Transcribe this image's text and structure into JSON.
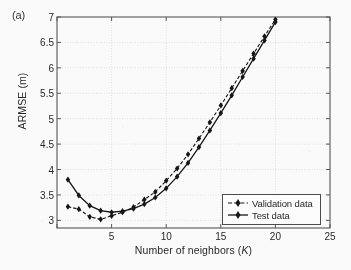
{
  "figure": {
    "panel_label": "(a)",
    "background_color": "#fdfdfd",
    "axis_color": "#555555",
    "grid_color": "#d9d9d9",
    "series_color": "#111111"
  },
  "chart_data": {
    "type": "line",
    "title": "",
    "panel": "(a)",
    "xlabel": "Number of neighbors (K)",
    "ylabel": "ARMSE (m)",
    "xlim": [
      0,
      25
    ],
    "ylim": [
      2.85,
      7
    ],
    "xticks": [
      0,
      5,
      10,
      15,
      20,
      25
    ],
    "xticklabels": [
      "",
      "5",
      "10",
      "15",
      "20",
      "25"
    ],
    "yticks": [
      3,
      3.5,
      4,
      4.5,
      5,
      5.5,
      6,
      6.5,
      7
    ],
    "yticklabels": [
      "3",
      "3.5",
      "4",
      "4.5",
      "5",
      "5.5",
      "6",
      "6.5",
      "7"
    ],
    "grid": true,
    "legend_position": "lower right",
    "marker": "diamond",
    "x": [
      1,
      2,
      3,
      4,
      5,
      6,
      7,
      8,
      9,
      10,
      11,
      12,
      13,
      14,
      15,
      16,
      17,
      18,
      19,
      20
    ],
    "series": [
      {
        "name": "Validation data",
        "linestyle": "dashed",
        "marker": "diamond",
        "color": "#111111",
        "values": [
          3.27,
          3.22,
          3.07,
          3.02,
          3.09,
          3.16,
          3.26,
          3.41,
          3.56,
          3.78,
          4.02,
          4.3,
          4.61,
          4.93,
          5.26,
          5.6,
          5.94,
          6.28,
          6.62,
          6.95
        ]
      },
      {
        "name": "Test data",
        "linestyle": "solid",
        "marker": "diamond",
        "color": "#111111",
        "values": [
          3.8,
          3.49,
          3.29,
          3.19,
          3.16,
          3.18,
          3.23,
          3.32,
          3.45,
          3.63,
          3.86,
          4.13,
          4.44,
          4.77,
          5.11,
          5.46,
          5.82,
          6.18,
          6.54,
          6.9
        ]
      }
    ]
  },
  "legend": {
    "items": [
      {
        "label": "Validation data",
        "linestyle": "dashed"
      },
      {
        "label": "Test data",
        "linestyle": "solid"
      }
    ]
  }
}
